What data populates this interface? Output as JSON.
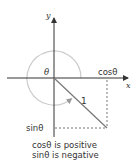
{
  "diagram": {
    "axes": {
      "x_label": "x",
      "y_label": "y"
    },
    "angle_label": "θ",
    "radius_label": "1",
    "cos_label": "cosθ",
    "sin_label": "sinθ",
    "caption": {
      "line1": "cosθ is positive",
      "line2": "sinθ is negative"
    },
    "colors": {
      "axis": "#333333",
      "radius": "#777777",
      "arc": "#cccccc",
      "dashed": "#555555",
      "text": "#333333"
    }
  }
}
